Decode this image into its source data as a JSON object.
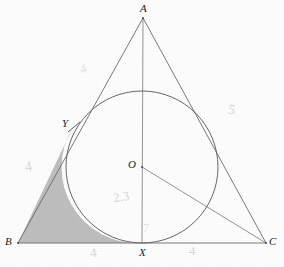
{
  "figure": {
    "type": "geometry-diagram",
    "canvas": {
      "width": 284,
      "height": 267,
      "background": "#fdfdfd"
    },
    "colors": {
      "stroke": "#6b6b6b",
      "stroke_dark": "#4a4a4a",
      "shade_fill": "#b9b9b9",
      "label_text": "#1d1d1d",
      "annotation_text": "#d2d2d2"
    },
    "points": [
      {
        "name": "A",
        "label": "A",
        "x": 143,
        "y": 18,
        "label_x": 140,
        "label_y": 3
      },
      {
        "name": "B",
        "label": "B",
        "x": 18,
        "y": 243,
        "label_x": 5,
        "label_y": 236
      },
      {
        "name": "C",
        "label": "C",
        "x": 266,
        "y": 243,
        "label_x": 269,
        "label_y": 236
      },
      {
        "name": "O",
        "label": "O",
        "x": 142,
        "y": 167,
        "label_x": 128,
        "label_y": 159
      },
      {
        "name": "X",
        "label": "X",
        "x": 142,
        "y": 243,
        "label_x": 139,
        "label_y": 247
      },
      {
        "name": "Y",
        "label": "Y",
        "x": 73,
        "y": 127,
        "label_x": 62,
        "label_y": 118
      }
    ],
    "circle": {
      "center_x": 142,
      "center_y": 167,
      "radius": 76
    },
    "segments": [
      {
        "name": "side-AB",
        "from": "A",
        "to": "B"
      },
      {
        "name": "side-AC",
        "from": "A",
        "to": "C"
      },
      {
        "name": "side-BC",
        "from": "B",
        "to": "C"
      },
      {
        "name": "axis-AX",
        "from": "A",
        "to": "X"
      },
      {
        "name": "radius-OC",
        "from": "O",
        "to": "C"
      }
    ],
    "shaded_region": {
      "name": "corner-B-region",
      "vertices": [
        "B",
        "Y",
        "X"
      ],
      "fill": "#b9b9b9"
    },
    "tick_marks": [
      {
        "name": "tangent-tick-Y",
        "x": 73,
        "y": 127
      }
    ],
    "annotations": [
      {
        "name": "annot-upper-left",
        "text": "4",
        "x": 80,
        "y": 62,
        "size": 13,
        "rotate": -18,
        "tone": "veryfaint"
      },
      {
        "name": "annot-right-side",
        "text": "5",
        "x": 228,
        "y": 103,
        "size": 14,
        "rotate": 12,
        "tone": "faint"
      },
      {
        "name": "annot-left-side",
        "text": "4",
        "x": 25,
        "y": 160,
        "size": 14,
        "rotate": -8,
        "tone": "faint"
      },
      {
        "name": "annot-center",
        "text": "2.3",
        "x": 113,
        "y": 190,
        "size": 13,
        "rotate": -10,
        "tone": "faint"
      },
      {
        "name": "annot-near-X",
        "text": "7",
        "x": 143,
        "y": 222,
        "size": 12,
        "rotate": 0,
        "tone": "veryfaint"
      },
      {
        "name": "annot-bottom-left",
        "text": "4",
        "x": 90,
        "y": 246,
        "size": 13,
        "rotate": -8,
        "tone": "faint"
      },
      {
        "name": "annot-bottom-right",
        "text": "4",
        "x": 189,
        "y": 244,
        "size": 13,
        "rotate": 0,
        "tone": "faint"
      }
    ]
  }
}
